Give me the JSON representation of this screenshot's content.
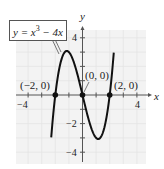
{
  "chart_data": {
    "type": "line",
    "title": "",
    "equation_label": "y = x^3 − 4x",
    "equation_parts": {
      "lhs": "y = x",
      "exp": "3",
      "rhs": " − 4x"
    },
    "xlabel": "x",
    "ylabel": "y",
    "xlim": [
      -4.5,
      4.5
    ],
    "ylim": [
      -4.5,
      4.5
    ],
    "x_ticks": [
      -4,
      -3,
      -2,
      -1,
      1,
      2,
      3,
      4
    ],
    "x_tick_labels": {
      "-4": "−4",
      "4": "4"
    },
    "y_ticks": [
      -4,
      -3,
      -2,
      -1,
      1,
      2,
      3,
      4
    ],
    "y_tick_labels": {
      "4": "4",
      "-2": "−2",
      "-4": "−4"
    },
    "grid": true,
    "series": [
      {
        "name": "y = x^3 − 4x",
        "function": "x^3 - 4x",
        "x_range": [
          -2.3,
          2.3
        ],
        "x": [
          -2.3,
          -2,
          -1.5,
          -1.15,
          -0.5,
          0,
          0.5,
          1.15,
          1.5,
          2,
          2.3
        ],
        "y": [
          -2.97,
          0,
          2.63,
          3.08,
          1.88,
          0,
          -1.88,
          -3.08,
          -2.63,
          0,
          2.97
        ]
      }
    ],
    "points": [
      {
        "x": -2,
        "y": 0,
        "label": "(−2, 0)"
      },
      {
        "x": 0,
        "y": 0,
        "label": "(0, 0)"
      },
      {
        "x": 2,
        "y": 0,
        "label": "(2, 0)"
      }
    ]
  },
  "labels": {
    "x_axis": "x",
    "y_axis": "y",
    "tick_x_neg4": "−4",
    "tick_x_4": "4",
    "tick_y_4": "4",
    "tick_y_neg2": "−2",
    "tick_y_neg4": "−4",
    "pt_neg2": "(−2, 0)",
    "pt_0": "(0, 0)",
    "pt_2": "(2, 0)",
    "eq_lhs": "y = x",
    "eq_exp": "3",
    "eq_rhs": " − 4x"
  },
  "colors": {
    "background": "#ffffff",
    "plot_area": "#f3f3f3",
    "grid": "#e2e2e2",
    "curve": "#111111",
    "axis": "#555555"
  }
}
